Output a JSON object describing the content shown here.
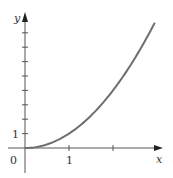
{
  "chart_data": {
    "type": "line",
    "title": "",
    "xlabel": "x",
    "ylabel": "y",
    "function": "y = x^2",
    "origin_label": "0",
    "x_tick_labels": [
      "1"
    ],
    "y_tick_labels": [
      "1"
    ],
    "x_ticks": [
      1,
      2
    ],
    "y_ticks": [
      1,
      2,
      3,
      4,
      5,
      6,
      7,
      8
    ],
    "xlim": [
      -0.4,
      3.1
    ],
    "ylim": [
      -1.7,
      9.4
    ],
    "grid": false,
    "legend": null,
    "series": [
      {
        "name": "curve",
        "x": [
          0,
          0.25,
          0.5,
          0.75,
          1,
          1.25,
          1.5,
          1.75,
          2,
          2.25,
          2.5,
          2.75,
          2.95
        ],
        "values": [
          0,
          0.0625,
          0.25,
          0.5625,
          1,
          1.5625,
          2.25,
          3.0625,
          4,
          5.0625,
          6.25,
          7.5625,
          8.7025
        ]
      }
    ]
  },
  "colors": {
    "axis": "#555555",
    "curve": "#6e6e6e",
    "text": "#333333"
  },
  "geometry": {
    "origin_px": [
      25,
      148
    ],
    "x_unit_px": 44,
    "y_unit_px": 14.4
  }
}
